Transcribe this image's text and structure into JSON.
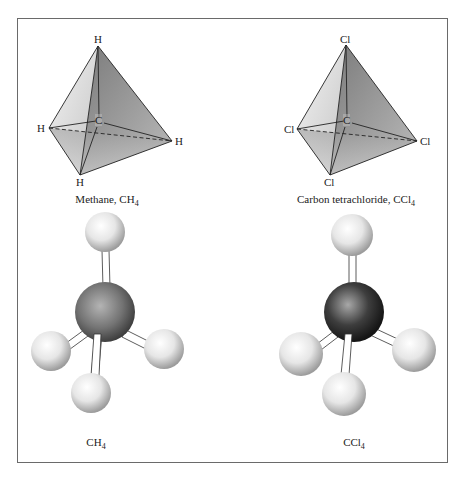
{
  "figure": {
    "panels": [
      {
        "id": "methane-tetrahedron",
        "caption": {
          "text": "Methane, CH",
          "sub": "4"
        },
        "center_atom": "C",
        "outer_atoms": {
          "top": "H",
          "left": "H",
          "right": "H",
          "bottom": "H"
        }
      },
      {
        "id": "ccl4-tetrahedron",
        "caption": {
          "text": "Carbon tetrachloride, CCl",
          "sub": "4"
        },
        "center_atom": "C",
        "outer_atoms": {
          "top": "Cl",
          "left": "Cl",
          "right": "Cl",
          "bottom": "Cl"
        }
      },
      {
        "id": "methane-ball-stick",
        "caption": {
          "text": "CH",
          "sub": "4"
        }
      },
      {
        "id": "ccl4-ball-stick",
        "caption": {
          "text": "CCl",
          "sub": "4"
        }
      }
    ]
  }
}
